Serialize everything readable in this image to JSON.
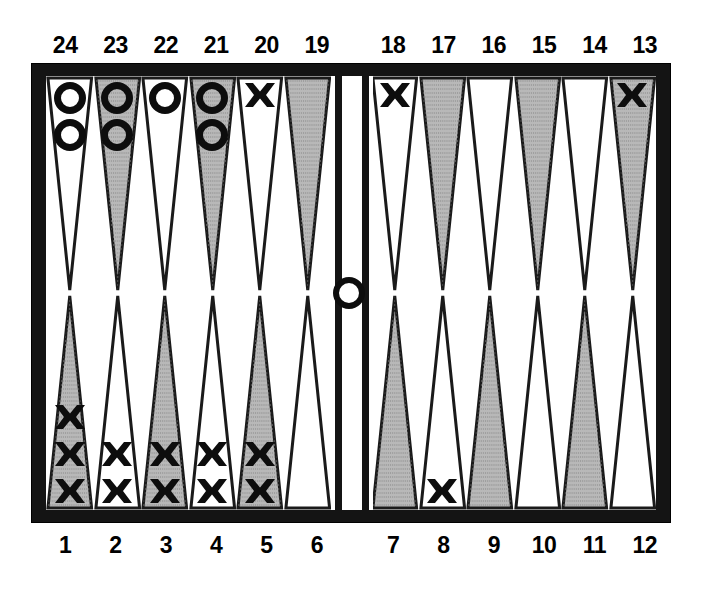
{
  "board": {
    "title": "Backgammon board diagram",
    "colors": {
      "frame": "#141414",
      "field": "#ffffff",
      "point_shaded": "#b8b8b8",
      "point_plain": "#ffffff",
      "checker": "#0d0d0d"
    },
    "top_labels": [
      "24",
      "23",
      "22",
      "21",
      "20",
      "19",
      "18",
      "17",
      "16",
      "15",
      "14",
      "13"
    ],
    "bottom_labels": [
      "1",
      "2",
      "3",
      "4",
      "5",
      "6",
      "7",
      "8",
      "9",
      "10",
      "11",
      "12"
    ],
    "bar": {
      "name": "bar",
      "checkers": 1,
      "piece": "O"
    },
    "points": [
      {
        "label": "24",
        "quadrant": "top-left",
        "shaded": false,
        "piece": "O",
        "count": 2
      },
      {
        "label": "23",
        "quadrant": "top-left",
        "shaded": true,
        "piece": "O",
        "count": 2
      },
      {
        "label": "22",
        "quadrant": "top-left",
        "shaded": false,
        "piece": "O",
        "count": 1
      },
      {
        "label": "21",
        "quadrant": "top-left",
        "shaded": true,
        "piece": "O",
        "count": 2
      },
      {
        "label": "20",
        "quadrant": "top-left",
        "shaded": false,
        "piece": "X",
        "count": 1
      },
      {
        "label": "19",
        "quadrant": "top-left",
        "shaded": true,
        "piece": "",
        "count": 0
      },
      {
        "label": "18",
        "quadrant": "top-right",
        "shaded": false,
        "piece": "X",
        "count": 1
      },
      {
        "label": "17",
        "quadrant": "top-right",
        "shaded": true,
        "piece": "",
        "count": 0
      },
      {
        "label": "16",
        "quadrant": "top-right",
        "shaded": false,
        "piece": "",
        "count": 0
      },
      {
        "label": "15",
        "quadrant": "top-right",
        "shaded": true,
        "piece": "",
        "count": 0
      },
      {
        "label": "14",
        "quadrant": "top-right",
        "shaded": false,
        "piece": "",
        "count": 0
      },
      {
        "label": "13",
        "quadrant": "top-right",
        "shaded": true,
        "piece": "X",
        "count": 1
      },
      {
        "label": "1",
        "quadrant": "bottom-left",
        "shaded": true,
        "piece": "X",
        "count": 3
      },
      {
        "label": "2",
        "quadrant": "bottom-left",
        "shaded": false,
        "piece": "X",
        "count": 2
      },
      {
        "label": "3",
        "quadrant": "bottom-left",
        "shaded": true,
        "piece": "X",
        "count": 2
      },
      {
        "label": "4",
        "quadrant": "bottom-left",
        "shaded": false,
        "piece": "X",
        "count": 2
      },
      {
        "label": "5",
        "quadrant": "bottom-left",
        "shaded": true,
        "piece": "X",
        "count": 2
      },
      {
        "label": "6",
        "quadrant": "bottom-left",
        "shaded": false,
        "piece": "",
        "count": 0
      },
      {
        "label": "7",
        "quadrant": "bottom-right",
        "shaded": true,
        "piece": "",
        "count": 0
      },
      {
        "label": "8",
        "quadrant": "bottom-right",
        "shaded": false,
        "piece": "X",
        "count": 1
      },
      {
        "label": "9",
        "quadrant": "bottom-right",
        "shaded": true,
        "piece": "",
        "count": 0
      },
      {
        "label": "10",
        "quadrant": "bottom-right",
        "shaded": false,
        "piece": "",
        "count": 0
      },
      {
        "label": "11",
        "quadrant": "bottom-right",
        "shaded": true,
        "piece": "",
        "count": 0
      },
      {
        "label": "12",
        "quadrant": "bottom-right",
        "shaded": false,
        "piece": "",
        "count": 0
      }
    ]
  }
}
